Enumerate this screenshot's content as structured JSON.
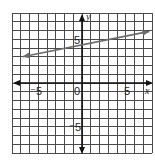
{
  "chart_data": {
    "type": "line",
    "title": "",
    "xlabel": "x",
    "ylabel": "y",
    "xlim": [
      -8,
      8
    ],
    "ylim": [
      -8,
      8
    ],
    "grid": true,
    "grid_step": 1,
    "x_tick_labels": [
      {
        "value": -5,
        "label": "⁻5"
      },
      {
        "value": 0,
        "label": "0"
      },
      {
        "value": 5,
        "label": "5"
      }
    ],
    "y_tick_labels": [
      {
        "value": 5,
        "label": "5"
      },
      {
        "value": -5,
        "label": "⁻5"
      }
    ],
    "series": [
      {
        "name": "line",
        "style": "double-arrow line",
        "color": "#6b6b6b",
        "x": [
          -6.8,
          7.7
        ],
        "y": [
          3.0,
          5.9
        ]
      }
    ],
    "legend": null
  },
  "labels": {
    "x_axis": "x",
    "y_axis": "y",
    "origin": "0",
    "x_neg5": "⁻5",
    "x_pos5": "5",
    "y_pos5": "5",
    "y_neg5": "⁻5"
  },
  "colors": {
    "grid": "#4a4a4a",
    "axis": "#111111",
    "line": "#6b6b6b"
  }
}
